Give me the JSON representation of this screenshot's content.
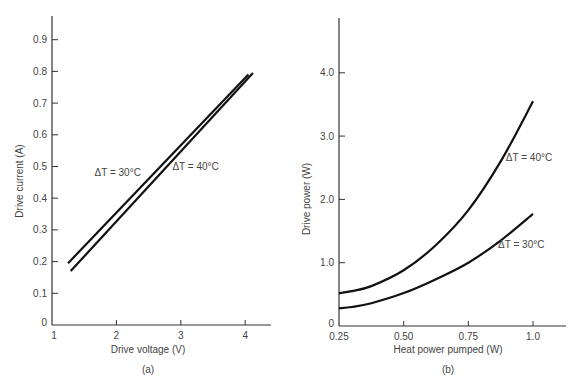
{
  "chart_data": [
    {
      "type": "line",
      "panel_label": "(a)",
      "title": "",
      "xlabel": "Drive voltage (V)",
      "ylabel": "Drive current (A)",
      "xlim": [
        1,
        4.4
      ],
      "ylim": [
        0,
        0.98
      ],
      "xticks": [
        1,
        2,
        3,
        4
      ],
      "xtick_labels": [
        "1",
        "2",
        "3",
        "4"
      ],
      "yticks": [
        0,
        0.1,
        0.2,
        0.3,
        0.4,
        0.5,
        0.6,
        0.7,
        0.8,
        0.9
      ],
      "ytick_labels": [
        "0",
        "0.1",
        "0.2",
        "0.3",
        "0.4",
        "0.5",
        "0.6",
        "0.7",
        "0.8",
        "0.9"
      ],
      "grid": false,
      "series": [
        {
          "name": "ΔT = 30°C",
          "x": [
            1.25,
            4.05
          ],
          "y": [
            0.195,
            0.79
          ]
        },
        {
          "name": "ΔT = 40°C",
          "x": [
            1.29,
            4.12
          ],
          "y": [
            0.17,
            0.795
          ]
        }
      ],
      "annotations": [
        {
          "text": "ΔT = 30°C",
          "series": "ΔT = 30°C",
          "x": 1.66,
          "y": 0.47
        },
        {
          "text": "ΔT = 40°C",
          "series": "ΔT = 40°C",
          "x": 2.87,
          "y": 0.49
        }
      ]
    },
    {
      "type": "line",
      "panel_label": "(b)",
      "title": "",
      "xlabel": "Heat power pumped (W)",
      "ylabel": "Drive power (W)",
      "xlim": [
        0.25,
        1.12
      ],
      "ylim": [
        0,
        4.85
      ],
      "xticks": [
        0.25,
        0.5,
        0.75,
        1.0
      ],
      "xtick_labels": [
        "0.25",
        "0.50",
        "0.75",
        "1.0"
      ],
      "yticks": [
        0,
        1.0,
        2.0,
        3.0,
        4.0
      ],
      "ytick_labels": [
        "0",
        "1.0",
        "2.0",
        "3.0",
        "4.0"
      ],
      "grid": false,
      "series": [
        {
          "name": "ΔT = 40°C",
          "x": [
            0.25,
            0.3,
            0.375,
            0.5,
            0.625,
            0.75,
            0.875,
            1.0
          ],
          "y": [
            0.52,
            0.55,
            0.63,
            0.88,
            1.28,
            1.83,
            2.6,
            3.55
          ]
        },
        {
          "name": "ΔT = 30°C",
          "x": [
            0.25,
            0.3,
            0.375,
            0.5,
            0.625,
            0.75,
            0.875,
            1.0
          ],
          "y": [
            0.28,
            0.3,
            0.36,
            0.52,
            0.74,
            1.0,
            1.35,
            1.77
          ]
        }
      ],
      "annotations": [
        {
          "text": "ΔT = 40°C",
          "series": "ΔT = 40°C",
          "x": 0.895,
          "y": 2.6
        },
        {
          "text": "ΔT = 30°C",
          "series": "ΔT = 30°C",
          "x": 0.865,
          "y": 1.23
        }
      ]
    }
  ]
}
